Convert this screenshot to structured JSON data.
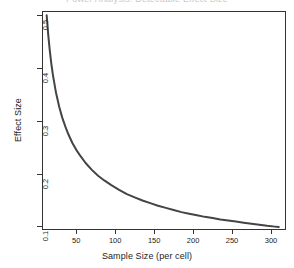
{
  "figure": {
    "clipped_title": "Power Analysis: Detectable Effect Size",
    "background_color": "#ffffff",
    "frame_color": "#333333"
  },
  "chart_data": {
    "type": "line",
    "title": "",
    "xlabel": "Sample Size (per cell)",
    "ylabel": "Effect Size",
    "xlim": [
      6,
      318
    ],
    "ylim": [
      0.095,
      0.508
    ],
    "grid": false,
    "legend": null,
    "series": [
      {
        "name": "Minimum detectable effect size",
        "color": "#444444",
        "line_width": 2,
        "x": [
          12,
          14,
          16,
          18,
          20,
          24,
          28,
          32,
          36,
          40,
          45,
          50,
          56,
          62,
          70,
          78,
          86,
          95,
          105,
          115,
          125,
          135,
          145,
          155,
          165,
          175,
          185,
          195,
          205,
          215,
          225,
          235,
          245,
          255,
          265,
          275,
          285,
          295,
          305,
          310
        ],
        "y": [
          0.5,
          0.463,
          0.433,
          0.408,
          0.387,
          0.353,
          0.327,
          0.306,
          0.289,
          0.274,
          0.258,
          0.245,
          0.232,
          0.22,
          0.207,
          0.196,
          0.187,
          0.178,
          0.169,
          0.161,
          0.155,
          0.149,
          0.144,
          0.139,
          0.135,
          0.131,
          0.127,
          0.124,
          0.121,
          0.118,
          0.116,
          0.113,
          0.111,
          0.109,
          0.107,
          0.105,
          0.103,
          0.101,
          0.0995,
          0.0988
        ]
      }
    ],
    "x_ticks": [
      {
        "value": 50,
        "label": "50"
      },
      {
        "value": 100,
        "label": "100"
      },
      {
        "value": 150,
        "label": "150"
      },
      {
        "value": 200,
        "label": "200"
      },
      {
        "value": 250,
        "label": "250"
      },
      {
        "value": 300,
        "label": "300"
      }
    ],
    "y_ticks": [
      {
        "value": 0.1,
        "label": "0.1"
      },
      {
        "value": 0.2,
        "label": "0.2"
      },
      {
        "value": 0.3,
        "label": "0.3"
      },
      {
        "value": 0.4,
        "label": "0.4"
      },
      {
        "value": 0.5,
        "label": "0.5"
      }
    ]
  }
}
